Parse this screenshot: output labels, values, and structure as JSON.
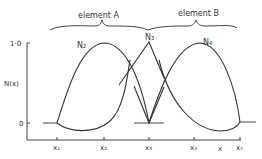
{
  "figure": {
    "element_labels": [
      "element A",
      "element B"
    ],
    "y_axis": {
      "label": "N(x)",
      "ticks": [
        "1·0",
        "0"
      ]
    },
    "x_axis": {
      "label": "x",
      "ticks": [
        "x₁",
        "x₂",
        "x₃",
        "x₄",
        "x₅"
      ]
    },
    "curve_labels": [
      "N₂",
      "N₃",
      "N₄"
    ]
  }
}
